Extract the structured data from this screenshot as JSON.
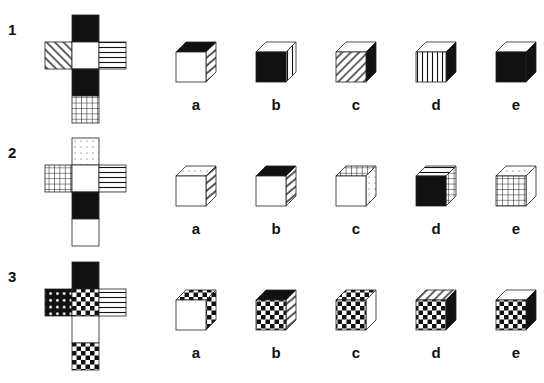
{
  "options": [
    "a",
    "b",
    "c",
    "d",
    "e"
  ],
  "problems": [
    {
      "number": "1",
      "net": {
        "origin": [
          45,
          15
        ],
        "cells": [
          {
            "col": 1,
            "row": 0,
            "pattern": "black"
          },
          {
            "col": 0,
            "row": 1,
            "pattern": "diag-back"
          },
          {
            "col": 1,
            "row": 1,
            "pattern": "white"
          },
          {
            "col": 2,
            "row": 1,
            "pattern": "hstripes"
          },
          {
            "col": 1,
            "row": 2,
            "pattern": "black"
          },
          {
            "col": 1,
            "row": 3,
            "pattern": "grid"
          }
        ]
      },
      "cubes": [
        {
          "label": "a",
          "front": "white",
          "top": "black",
          "side": "hstripes-diag"
        },
        {
          "label": "b",
          "front": "black",
          "top": "white",
          "side": "vstripes"
        },
        {
          "label": "c",
          "front": "diag-fwd",
          "top": "white",
          "side": "black"
        },
        {
          "label": "d",
          "front": "vstripes",
          "top": "white",
          "side": "black"
        },
        {
          "label": "e",
          "front": "black",
          "top": "white",
          "side": "black"
        }
      ]
    },
    {
      "number": "2",
      "net": {
        "origin": [
          45,
          138
        ],
        "cells": [
          {
            "col": 1,
            "row": 0,
            "pattern": "dots"
          },
          {
            "col": 0,
            "row": 1,
            "pattern": "grid"
          },
          {
            "col": 1,
            "row": 1,
            "pattern": "white"
          },
          {
            "col": 2,
            "row": 1,
            "pattern": "hstripes"
          },
          {
            "col": 1,
            "row": 2,
            "pattern": "black"
          },
          {
            "col": 1,
            "row": 3,
            "pattern": "white"
          }
        ]
      },
      "cubes": [
        {
          "label": "a",
          "front": "white",
          "top": "dots",
          "side": "hstripes-diag"
        },
        {
          "label": "b",
          "front": "white",
          "top": "black",
          "side": "hstripes-diag"
        },
        {
          "label": "c",
          "front": "white",
          "top": "grid",
          "side": "dots"
        },
        {
          "label": "d",
          "front": "black",
          "top": "hstripes",
          "side": "grid"
        },
        {
          "label": "e",
          "front": "grid",
          "top": "dots",
          "side": "white"
        }
      ]
    },
    {
      "number": "3",
      "net": {
        "origin": [
          45,
          262
        ],
        "cells": [
          {
            "col": 1,
            "row": 0,
            "pattern": "black"
          },
          {
            "col": 0,
            "row": 1,
            "pattern": "black-dots"
          },
          {
            "col": 1,
            "row": 1,
            "pattern": "checker"
          },
          {
            "col": 2,
            "row": 1,
            "pattern": "hstripes"
          },
          {
            "col": 1,
            "row": 2,
            "pattern": "white"
          },
          {
            "col": 1,
            "row": 3,
            "pattern": "checker"
          }
        ]
      },
      "cubes": [
        {
          "label": "a",
          "front": "white",
          "top": "checker",
          "side": "checker"
        },
        {
          "label": "b",
          "front": "checker",
          "top": "black",
          "side": "hstripes-diag"
        },
        {
          "label": "c",
          "front": "checker",
          "top": "checker",
          "side": "white"
        },
        {
          "label": "d",
          "front": "checker",
          "top": "diag-fwd",
          "side": "black"
        },
        {
          "label": "e",
          "front": "checker",
          "top": "white",
          "side": "black"
        }
      ]
    }
  ]
}
